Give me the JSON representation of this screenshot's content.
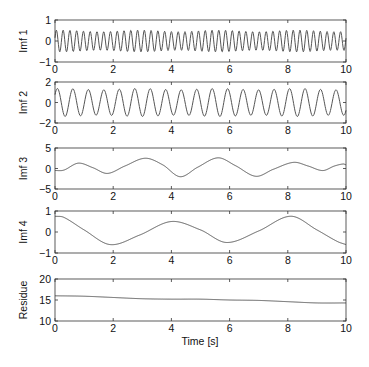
{
  "figure": {
    "xlabel": "Time [s]",
    "background": "#ffffff",
    "line_color": "#555555",
    "axis_color": "#333333"
  },
  "chart_data": [
    {
      "type": "line",
      "ylabel": "Imf 1",
      "xlim": [
        0,
        10
      ],
      "ylim": [
        -1,
        1
      ],
      "xticks": [
        "0",
        "2",
        "4",
        "6",
        "8",
        "10"
      ],
      "yticks": [
        "-1",
        "0",
        "1"
      ],
      "yticks_values": [
        -1,
        0,
        1
      ],
      "grid": false,
      "description": "high-frequency oscillation, ~4.3 Hz, amplitude ~0.5",
      "model": {
        "kind": "sine",
        "freq": 4.3,
        "amp": 0.48,
        "phase": 0.3,
        "offset": 0.0,
        "amp_jitter": 0.08
      }
    },
    {
      "type": "line",
      "ylabel": "Imf 2",
      "xlim": [
        0,
        10
      ],
      "ylim": [
        -2,
        2
      ],
      "xticks": [
        "0",
        "2",
        "4",
        "6",
        "8",
        "10"
      ],
      "yticks": [
        "-2",
        "0",
        "2"
      ],
      "yticks_values": [
        -2,
        0,
        2
      ],
      "grid": false,
      "description": "oscillation ~1.9 Hz, amplitude ~1.3",
      "model": {
        "kind": "sine",
        "freq": 1.88,
        "amp": 1.3,
        "phase": 0.6,
        "offset": 0.0,
        "amp_jitter": 0.05
      }
    },
    {
      "type": "line",
      "ylabel": "Imf 3",
      "xlim": [
        0,
        10
      ],
      "ylim": [
        -5,
        5
      ],
      "xticks": [
        "0",
        "2",
        "4",
        "6",
        "8",
        "10"
      ],
      "yticks": [
        "-5",
        "0",
        "5"
      ],
      "yticks_values": [
        -5,
        0,
        5
      ],
      "grid": false,
      "x": [
        0,
        0.3,
        0.8,
        1.3,
        1.8,
        2.4,
        3.1,
        3.7,
        4.3,
        4.9,
        5.6,
        6.2,
        6.9,
        7.5,
        8.2,
        8.7,
        9.2,
        9.6,
        9.9,
        10
      ],
      "y": [
        -0.5,
        -0.4,
        1.3,
        0.2,
        -1.2,
        0.6,
        2.5,
        0.9,
        -2.0,
        0.3,
        2.6,
        0.7,
        -1.9,
        -0.2,
        1.5,
        0.6,
        -0.5,
        0.6,
        1.1,
        0.9
      ]
    },
    {
      "type": "line",
      "ylabel": "Imf 4",
      "xlim": [
        0,
        10
      ],
      "ylim": [
        -1,
        1
      ],
      "xticks": [
        "0",
        "2",
        "4",
        "6",
        "8",
        "10"
      ],
      "yticks": [
        "-1",
        "0",
        "1"
      ],
      "yticks_values": [
        -1,
        0,
        1
      ],
      "grid": false,
      "x": [
        0,
        0.3,
        1.0,
        1.9,
        2.9,
        4.0,
        5.0,
        5.9,
        7.0,
        8.1,
        9.0,
        9.7,
        10
      ],
      "y": [
        0.75,
        0.7,
        0.1,
        -0.6,
        -0.15,
        0.5,
        0.1,
        -0.5,
        0.05,
        0.75,
        0.1,
        -0.45,
        -0.6
      ]
    },
    {
      "type": "line",
      "ylabel": "Residue",
      "xlim": [
        0,
        10
      ],
      "ylim": [
        10,
        20
      ],
      "xticks": [
        "0",
        "2",
        "4",
        "6",
        "8",
        "10"
      ],
      "yticks": [
        "10",
        "15",
        "20"
      ],
      "yticks_values": [
        10,
        15,
        20
      ],
      "grid": false,
      "x": [
        0,
        1,
        2,
        3,
        4,
        5,
        6,
        7,
        8,
        9,
        10
      ],
      "y": [
        16.0,
        15.9,
        15.6,
        15.3,
        15.2,
        15.2,
        15.0,
        14.9,
        14.6,
        14.3,
        14.3
      ]
    }
  ]
}
